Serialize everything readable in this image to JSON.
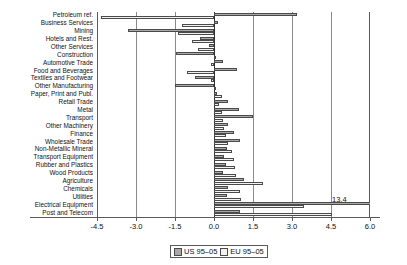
{
  "chart_data": {
    "type": "bar",
    "orientation": "horizontal",
    "title": "",
    "xlabel": "",
    "ylabel": "",
    "xlim": [
      -4.5,
      6.0
    ],
    "xticks": [
      -4.5,
      -3.0,
      -1.5,
      0.0,
      1.5,
      3.0,
      4.5,
      6.0
    ],
    "xticklabels": [
      "-4.5",
      "-3.0",
      "-1.5",
      "0.0",
      "1.5",
      "3.0",
      "4.5",
      "6.0"
    ],
    "grid": true,
    "legend_position": "bottom-center",
    "categories": [
      "Petroleum ref.",
      "Business Services",
      "Mining",
      "Hotels and Rest.",
      "Other Services",
      "Construction",
      "Automotive Trade",
      "Food and Beverages",
      "Textiles and Footwear",
      "Other Manufacturing",
      "Paper, Print and Publ.",
      "Retail Trade",
      "Metal",
      "Transport",
      "Other Machinery",
      "Finance",
      "Wholesale Trade",
      "Non-Metallic Mineral",
      "Transport Equipment",
      "Rubber and Plastics",
      "Wood Products",
      "Agriculture",
      "Chemicals",
      "Utilities",
      "Electrical Equipment",
      "Post and Telecom"
    ],
    "series": [
      {
        "name": "US 95-05",
        "color": "#a8a8a8",
        "values": [
          3.2,
          0.15,
          -3.3,
          -0.55,
          -0.2,
          -1.45,
          0.35,
          0.9,
          -0.75,
          -1.5,
          0.1,
          0.55,
          0.95,
          1.5,
          0.55,
          0.75,
          1.0,
          0.5,
          0.4,
          0.45,
          0.35,
          1.15,
          0.55,
          0.5,
          13.4,
          1.0
        ]
      },
      {
        "name": "EU 95-05",
        "color": "#f2f2f2",
        "values": [
          -4.35,
          -1.25,
          -1.4,
          -0.85,
          -0.6,
          0.05,
          -0.1,
          -1.05,
          -0.1,
          0.05,
          0.3,
          0.2,
          0.3,
          0.35,
          0.4,
          0.45,
          0.55,
          0.7,
          0.75,
          0.8,
          0.85,
          1.9,
          1.0,
          1.05,
          3.45,
          4.55
        ]
      }
    ],
    "annotations": [
      {
        "text": "13.4",
        "category": "Electrical Equipment",
        "series": "US 95-05",
        "value": 13.4
      }
    ]
  },
  "legend": {
    "items": [
      {
        "label": "US 95–05",
        "swatch": "us"
      },
      {
        "label": "EU 95–05",
        "swatch": "eu"
      }
    ]
  }
}
